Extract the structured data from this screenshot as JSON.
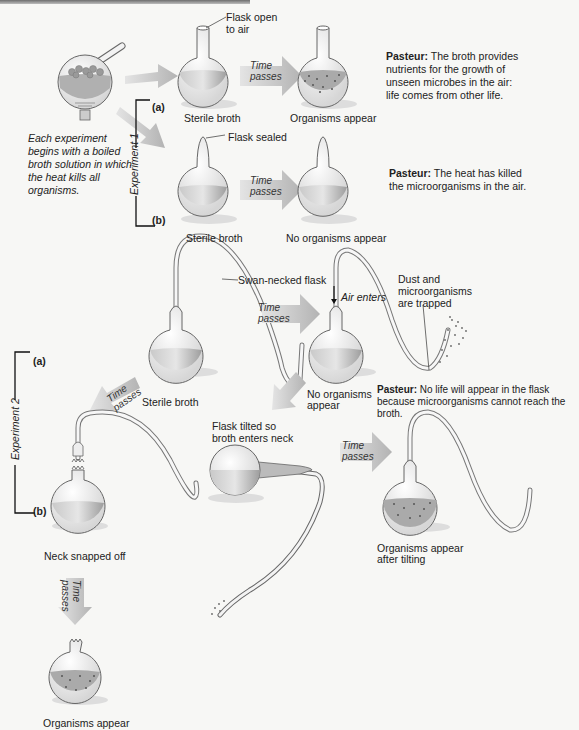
{
  "intro": {
    "text": "Each experiment begins with a boiled broth solution in which the heat kills all organisms."
  },
  "arrows": {
    "time_passes": "Time passes",
    "time_word": "Time",
    "passes_word": "passes"
  },
  "experiment1": {
    "label": "Experiment 1",
    "part_a": {
      "tag": "(a)",
      "flask_callout": "Flask open to air",
      "flask_callout_line1": "Flask open",
      "flask_callout_line2": "to air",
      "start_caption": "Sterile broth",
      "end_caption": "Organisms appear",
      "pasteur_label": "Pasteur:",
      "pasteur_text": "The broth provides nutrients for the growth of unseen microbes in the air: life comes from other life."
    },
    "part_b": {
      "tag": "(b)",
      "flask_callout": "Flask sealed",
      "start_caption": "Sterile broth",
      "end_caption": "No organisms appear",
      "pasteur_label": "Pasteur:",
      "pasteur_text": "The heat has killed the microorganisms in the air."
    }
  },
  "experiment2": {
    "label": "Experiment 2",
    "part_a": {
      "tag": "(a)",
      "flask_callout": "Swan-necked flask",
      "start_caption": "Sterile broth",
      "air_callout": "Air enters",
      "dust_callout_line1": "Dust and",
      "dust_callout_line2": "microorganisms",
      "dust_callout_line3": "are trapped",
      "end_caption_line1": "No organisms",
      "end_caption_line2": "appear",
      "pasteur_label": "Pasteur:",
      "pasteur_text": "No life will appear in the flask because microorganisms cannot reach the broth.",
      "tilt_caption_line1": "Flask tilted so",
      "tilt_caption_line2": "broth enters neck",
      "tilt_result_line1": "Organisms appear",
      "tilt_result_line2": "after tilting"
    },
    "part_b": {
      "tag": "(b)",
      "snap_caption": "Neck snapped off",
      "end_caption": "Organisms appear"
    }
  },
  "colors": {
    "background": "#f7f7f5",
    "arrow_fill": "#b9b9b9",
    "broth": "#a9a9a9",
    "glass_outline": "#555555",
    "organism_dots": "#555555"
  }
}
